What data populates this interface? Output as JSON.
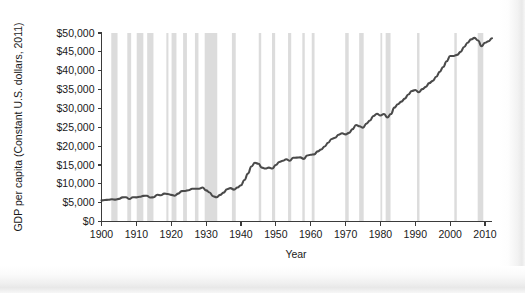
{
  "chart_data": {
    "type": "line",
    "title": "",
    "xlabel": "Year",
    "ylabel": "GDP per capita (Constant U.S. dollars, 2011)",
    "xlim": [
      1900,
      2012
    ],
    "ylim": [
      0,
      50000
    ],
    "grid": false,
    "legend": "none",
    "y_tick_labels": [
      "$0",
      "$5,000",
      "$10,000",
      "$15,000",
      "$20,000",
      "$25,000",
      "$30,000",
      "$35,000",
      "$40,000",
      "$45,000",
      "$50,000"
    ],
    "y_tick_values": [
      0,
      5000,
      10000,
      15000,
      20000,
      25000,
      30000,
      35000,
      40000,
      45000,
      50000
    ],
    "x_tick_labels": [
      "1900",
      "1910",
      "1920",
      "1930",
      "1940",
      "1950",
      "1960",
      "1970",
      "1980",
      "1990",
      "2000",
      "2010"
    ],
    "x_tick_values": [
      1900,
      1910,
      1920,
      1930,
      1940,
      1950,
      1960,
      1970,
      1980,
      1990,
      2000,
      2010
    ],
    "series": [
      {
        "name": "GDP per capita",
        "color": "#4a4a4a",
        "x": [
          1900,
          1901,
          1902,
          1903,
          1904,
          1905,
          1906,
          1907,
          1908,
          1909,
          1910,
          1911,
          1912,
          1913,
          1914,
          1915,
          1916,
          1917,
          1918,
          1919,
          1920,
          1921,
          1922,
          1923,
          1924,
          1925,
          1926,
          1927,
          1928,
          1929,
          1930,
          1931,
          1932,
          1933,
          1934,
          1935,
          1936,
          1937,
          1938,
          1939,
          1940,
          1941,
          1942,
          1943,
          1944,
          1945,
          1946,
          1947,
          1948,
          1949,
          1950,
          1951,
          1952,
          1953,
          1954,
          1955,
          1956,
          1957,
          1958,
          1959,
          1960,
          1961,
          1962,
          1963,
          1964,
          1965,
          1966,
          1967,
          1968,
          1969,
          1970,
          1971,
          1972,
          1973,
          1974,
          1975,
          1976,
          1977,
          1978,
          1979,
          1980,
          1981,
          1982,
          1983,
          1984,
          1985,
          1986,
          1987,
          1988,
          1989,
          1990,
          1991,
          1992,
          1993,
          1994,
          1995,
          1996,
          1997,
          1998,
          1999,
          2000,
          2001,
          2002,
          2003,
          2004,
          2005,
          2006,
          2007,
          2008,
          2009,
          2010,
          2011,
          2012
        ],
        "values": [
          5600,
          5700,
          5750,
          5900,
          5800,
          6000,
          6400,
          6450,
          5950,
          6450,
          6400,
          6550,
          6800,
          6850,
          6350,
          6450,
          7100,
          6950,
          7400,
          7300,
          7050,
          6850,
          7400,
          8050,
          8100,
          8300,
          8700,
          8700,
          8700,
          9000,
          8250,
          7700,
          6700,
          6450,
          7050,
          7650,
          8550,
          8850,
          8450,
          9000,
          9600,
          11000,
          12700,
          14600,
          15600,
          15300,
          14300,
          14050,
          14300,
          14050,
          15000,
          15800,
          16100,
          16500,
          16100,
          16900,
          16950,
          17000,
          16600,
          17500,
          17700,
          17800,
          18600,
          19100,
          19900,
          20900,
          21900,
          22200,
          23000,
          23400,
          23100,
          23500,
          24500,
          25600,
          25250,
          24900,
          25950,
          26800,
          28000,
          28600,
          28100,
          28500,
          27600,
          28500,
          30200,
          31100,
          31800,
          32600,
          33700,
          34600,
          34900,
          34300,
          35100,
          35700,
          36700,
          37300,
          38400,
          39700,
          41000,
          42500,
          43900,
          43900,
          44200,
          45000,
          46300,
          47400,
          48300,
          48700,
          48000,
          46500,
          47400,
          47800,
          48600
        ]
      }
    ],
    "recession_bands": [
      {
        "start": 1902.8,
        "end": 1904.6
      },
      {
        "start": 1907.4,
        "end": 1908.5
      },
      {
        "start": 1910.1,
        "end": 1912.0
      },
      {
        "start": 1913.1,
        "end": 1914.9
      },
      {
        "start": 1918.6,
        "end": 1919.2
      },
      {
        "start": 1920.1,
        "end": 1921.5
      },
      {
        "start": 1923.4,
        "end": 1924.5
      },
      {
        "start": 1926.8,
        "end": 1927.8
      },
      {
        "start": 1929.6,
        "end": 1933.2
      },
      {
        "start": 1937.4,
        "end": 1938.5
      },
      {
        "start": 1945.1,
        "end": 1945.8
      },
      {
        "start": 1948.9,
        "end": 1949.8
      },
      {
        "start": 1953.5,
        "end": 1954.4
      },
      {
        "start": 1957.6,
        "end": 1958.3
      },
      {
        "start": 1960.3,
        "end": 1961.1
      },
      {
        "start": 1969.9,
        "end": 1970.9
      },
      {
        "start": 1973.9,
        "end": 1975.2
      },
      {
        "start": 1980.0,
        "end": 1980.5
      },
      {
        "start": 1981.5,
        "end": 1982.9
      },
      {
        "start": 1990.5,
        "end": 1991.2
      },
      {
        "start": 2001.2,
        "end": 2001.9
      },
      {
        "start": 2007.9,
        "end": 2009.5
      }
    ],
    "band_color": "#d6d6d6",
    "line_color": "#4a4a4a",
    "axis_color": "#3b3b3b",
    "background_color": "#ffffff"
  }
}
